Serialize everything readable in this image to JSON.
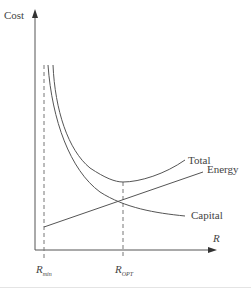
{
  "diagram": {
    "type": "cost-optimization-curves",
    "y_axis_label": "Cost",
    "x_axis_label": "R",
    "x_markers": [
      {
        "base": "R",
        "subscript": "min"
      },
      {
        "base": "R",
        "subscript": "OPT"
      }
    ],
    "curves": [
      {
        "name": "Total",
        "label": "Total",
        "shape": "U-shaped, minimum at R_OPT"
      },
      {
        "name": "Energy",
        "label": "Energy",
        "shape": "linear increasing"
      },
      {
        "name": "Capital",
        "label": "Capital",
        "shape": "decreasing hyperbolic"
      }
    ],
    "colors": {
      "line": "#555555",
      "text": "#444444",
      "background": "#ffffff"
    }
  }
}
